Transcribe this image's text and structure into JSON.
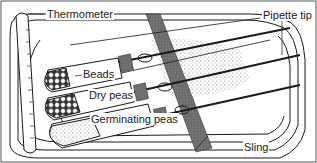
{
  "diagram": {
    "labels": {
      "thermometer": "Thermometer",
      "pipette_tip": "Pipette tip",
      "beads": "Beads",
      "dry_peas": "Dry peas",
      "germinating_peas": "Germinating peas",
      "sling": "Sling"
    },
    "thermometer_ticks": [
      "80",
      "70",
      "60",
      "50",
      "40",
      "30",
      "20",
      "10",
      "0",
      "-10",
      "-20"
    ],
    "colors": {
      "line": "#1a1a1a",
      "sling": "#6e6e6e",
      "speckle": "#9a9a9a",
      "background": "#ffffff"
    }
  }
}
